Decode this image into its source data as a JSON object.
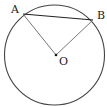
{
  "diagram": {
    "type": "circle-geometry",
    "circle": {
      "cx": 55,
      "cy": 55,
      "r": 50,
      "stroke": "#444444"
    },
    "points": {
      "A": {
        "label": "A",
        "x": 23,
        "y": 14
      },
      "B": {
        "label": "B",
        "x": 93,
        "y": 20
      },
      "O": {
        "label": "O",
        "x": 56,
        "y": 55
      }
    },
    "segments": [
      {
        "name": "chord-AB",
        "from": "A",
        "to": "B",
        "color": "#222222"
      },
      {
        "name": "radius-OA",
        "from": "O",
        "to": "A",
        "color": "#777777"
      },
      {
        "name": "radius-OB",
        "from": "O",
        "to": "B",
        "color": "#777777"
      }
    ]
  }
}
